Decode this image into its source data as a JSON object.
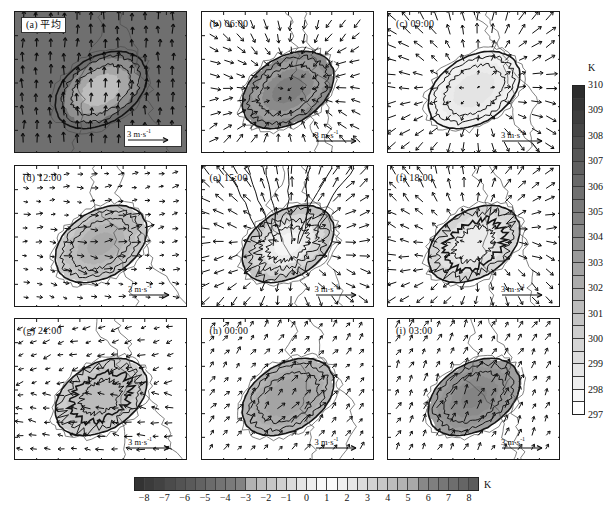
{
  "figure": {
    "title_visible": false,
    "rows": 3,
    "cols": 3,
    "background": "#ffffff"
  },
  "panels": [
    {
      "id": "a",
      "label": "(a) 平均",
      "label_boxed": true,
      "shaded_background": true,
      "vector_legend": "3 m·s",
      "vector_legend_exp": "-1",
      "legend_boxed": true
    },
    {
      "id": "b",
      "label": "(b) 06:00",
      "label_boxed": false,
      "shaded_background": false,
      "vector_legend": "3 m·s",
      "vector_legend_exp": "-1",
      "legend_boxed": false
    },
    {
      "id": "c",
      "label": "(c) 09:00",
      "label_boxed": false,
      "shaded_background": false,
      "vector_legend": "3 m·s",
      "vector_legend_exp": "-1",
      "legend_boxed": false
    },
    {
      "id": "d",
      "label": "(d) 12:00",
      "label_boxed": false,
      "shaded_background": false,
      "vector_legend": "3 m·s",
      "vector_legend_exp": "-1",
      "legend_boxed": false
    },
    {
      "id": "e",
      "label": "(e) 15:00",
      "label_boxed": false,
      "shaded_background": false,
      "vector_legend": "3 m·s",
      "vector_legend_exp": "-1",
      "legend_boxed": false
    },
    {
      "id": "f",
      "label": "(f) 18:00",
      "label_boxed": false,
      "shaded_background": false,
      "vector_legend": "3 m·s",
      "vector_legend_exp": "-1",
      "legend_boxed": false
    },
    {
      "id": "g",
      "label": "(g) 21:00",
      "label_boxed": false,
      "shaded_background": false,
      "vector_legend": "3 m·s",
      "vector_legend_exp": "-1",
      "legend_boxed": false
    },
    {
      "id": "h",
      "label": "(h) 00:00",
      "label_boxed": false,
      "shaded_background": false,
      "vector_legend": "3 m·s",
      "vector_legend_exp": "-1",
      "legend_boxed": false
    },
    {
      "id": "i",
      "label": "(i) 03:00",
      "label_boxed": false,
      "shaded_background": false,
      "vector_legend": "3 m·s",
      "vector_legend_exp": "-1",
      "legend_boxed": false
    }
  ],
  "chart_data": {
    "type": "heatmap",
    "title": "",
    "subtitle": "",
    "xlabel": "",
    "ylabel": "",
    "grid": false,
    "legend_position": "right and bottom",
    "panel_sequence": [
      "(a) 平均",
      "(b) 06:00",
      "(c) 09:00",
      "(d) 12:00",
      "(e) 15:00",
      "(f) 18:00",
      "(g) 21:00",
      "(h) 00:00",
      "(i) 03:00"
    ],
    "colorbars": [
      {
        "name": "vertical-temperature-colorbar",
        "orientation": "vertical",
        "unit": "K",
        "ticks": [
          310,
          309,
          308,
          307,
          306,
          305,
          304,
          303,
          302,
          301,
          300,
          299,
          298,
          297
        ],
        "min": 297,
        "max": 310,
        "n_segments": 26,
        "dark_end": "top",
        "applies_to": [
          "a"
        ]
      },
      {
        "name": "horizontal-anomaly-colorbar",
        "orientation": "horizontal",
        "unit": "K",
        "ticks": [
          -8,
          -7,
          -6,
          -5,
          -4,
          -3,
          -2,
          -1,
          0,
          1,
          2,
          3,
          4,
          5,
          6,
          7,
          8
        ],
        "min": -8,
        "max": 8,
        "n_segments": 34,
        "dark_ends": "both",
        "applies_to": [
          "b",
          "c",
          "d",
          "e",
          "f",
          "g",
          "h",
          "i"
        ]
      }
    ],
    "vector_scale": {
      "magnitude": 3,
      "unit": "m·s⁻¹",
      "label": "3 m·s-1"
    }
  },
  "colors": {
    "frame": "#1a1a1a",
    "panel_bg": "#ffffff",
    "panel_bg_dark": "#6f6f6f",
    "vector": "#111111",
    "coast": "#4a4a4a",
    "contour": "#151515"
  }
}
